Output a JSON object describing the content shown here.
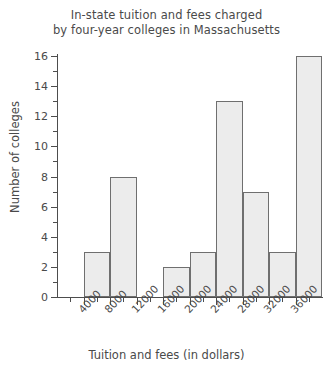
{
  "chart_data": {
    "type": "bar",
    "title": "In-state tuition and fees charged by four-year colleges in Massachusetts",
    "title_lines": [
      "In-state tuition and fees charged",
      "by four-year colleges in Massachusetts"
    ],
    "xlabel": "Tuition and fees (in dollars)",
    "ylabel": "Number of colleges",
    "grid": false,
    "legend": null,
    "ylim": [
      0,
      16
    ],
    "xlim": [
      0,
      40000
    ],
    "bin_width": 4000,
    "y_ticks": [
      0,
      2,
      4,
      6,
      8,
      10,
      12,
      14,
      16
    ],
    "y_tick_labels": [
      "0",
      "2",
      "4",
      "6",
      "8",
      "10",
      "12",
      "14",
      "16"
    ],
    "y_minor_ticks": [
      1,
      3,
      5,
      7,
      9,
      11,
      13,
      15
    ],
    "x_ticks": [
      4000,
      8000,
      12000,
      16000,
      20000,
      24000,
      28000,
      32000,
      36000
    ],
    "x_tick_labels": [
      "4000",
      "8000",
      "12000",
      "16000",
      "20000",
      "24000",
      "28000",
      "32000",
      "36000"
    ],
    "x_minor_ticks": [
      2000,
      6000,
      10000,
      14000,
      18000,
      22000,
      26000,
      30000,
      34000,
      38000
    ],
    "bins": [
      {
        "start": 0,
        "end": 4000,
        "label": "0-4000",
        "value": 0
      },
      {
        "start": 4000,
        "end": 8000,
        "label": "4000-8000",
        "value": 3
      },
      {
        "start": 8000,
        "end": 12000,
        "label": "8000-12000",
        "value": 8
      },
      {
        "start": 12000,
        "end": 16000,
        "label": "12000-16000",
        "value": 0
      },
      {
        "start": 16000,
        "end": 20000,
        "label": "16000-20000",
        "value": 2
      },
      {
        "start": 20000,
        "end": 24000,
        "label": "20000-24000",
        "value": 3
      },
      {
        "start": 24000,
        "end": 28000,
        "label": "24000-28000",
        "value": 13
      },
      {
        "start": 28000,
        "end": 32000,
        "label": "28000-32000",
        "value": 7
      },
      {
        "start": 32000,
        "end": 36000,
        "label": "32000-36000",
        "value": 3
      },
      {
        "start": 36000,
        "end": 40000,
        "label": "36000-40000",
        "value": 16
      }
    ],
    "categories": [
      "0-4000",
      "4000-8000",
      "8000-12000",
      "12000-16000",
      "16000-20000",
      "20000-24000",
      "24000-28000",
      "28000-32000",
      "32000-36000",
      "36000-40000"
    ],
    "values": [
      0,
      3,
      8,
      0,
      2,
      3,
      13,
      7,
      3,
      16
    ]
  },
  "style": {
    "bar_fill": "#ececec",
    "bar_stroke": "#6f6f6f",
    "axis_color": "#4d4d4d",
    "text_color": "#4a4a4a",
    "background": "#ffffff"
  }
}
